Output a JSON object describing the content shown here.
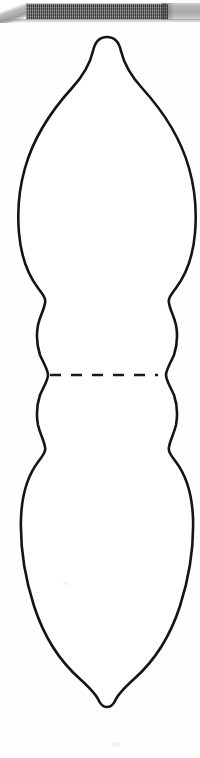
{
  "page": {
    "background_color": "#fefefe",
    "width": 200,
    "height": 758
  },
  "scan_header": {
    "name": "scan-artifact-bar",
    "light_band_color": "#b6b6b6",
    "dark_band_color": "#3a3a3a",
    "dark_band_start_x": 23,
    "dark_band_end_x": 168,
    "band_top_y": 3,
    "band_height": 17
  },
  "figure": {
    "name": "two-bulb-vessel-outline",
    "stroke_color": "#141414",
    "fill_color": "#ffffff",
    "stroke_width": 2.6,
    "top_tip_y": 37,
    "bottom_tip_y": 706,
    "center_x": 107,
    "upper_bulb": {
      "widest_y": 200,
      "left_x": 18,
      "right_x": 176
    },
    "lower_bulb": {
      "widest_y": 545,
      "left_x": 21,
      "right_x": 173
    },
    "waist": {
      "narrow_upper_y": 300,
      "narrow_lower_y": 445,
      "collar_bulge_left_x": 38,
      "collar_bulge_right_x": 157
    }
  },
  "parting_line": {
    "name": "dashed-parting-line",
    "y": 375,
    "start_x": 50,
    "end_x": 158,
    "dash_length": 11,
    "gap_length": 10,
    "dash_count": 5,
    "color": "#1a1a1a"
  }
}
